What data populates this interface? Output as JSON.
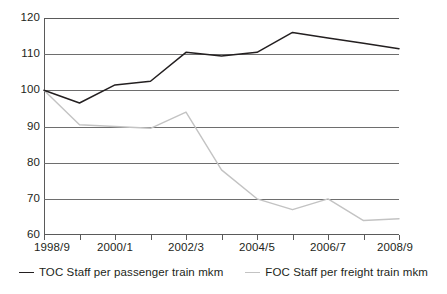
{
  "chart_data": {
    "type": "line",
    "title": "",
    "subtitle": "",
    "xlabel": "",
    "ylabel": "",
    "ylim": [
      60,
      120
    ],
    "yticks": [
      120,
      110,
      100,
      90,
      80,
      70,
      60
    ],
    "grid": true,
    "legend_position": "bottom",
    "x": [
      "1998/9",
      "1999/0",
      "2000/1",
      "2001/2",
      "2002/3",
      "2003/4",
      "2004/5",
      "2005/6",
      "2006/7",
      "2007/8",
      "2008/9"
    ],
    "categories": [
      "1998/9",
      "1999/0",
      "2000/1",
      "2001/2",
      "2002/3",
      "2003/4",
      "2004/5",
      "2005/6",
      "2006/7",
      "2007/8",
      "2008/9"
    ],
    "xtick_labels_shown": [
      "1998/9",
      "",
      "2000/1",
      "",
      "2002/3",
      "",
      "2004/5",
      "",
      "2006/7",
      "",
      "2008/9"
    ],
    "series": [
      {
        "name": "TOC Staff per passenger train mkm",
        "color": "#231f20",
        "values": [
          100,
          96.5,
          101.5,
          102.5,
          110.5,
          109.5,
          110.5,
          116,
          114.5,
          113,
          111.5
        ]
      },
      {
        "name": "FOC Staff per freight train mkm",
        "color": "#c3c3c3",
        "values": [
          100,
          90.5,
          90,
          89.5,
          94,
          78,
          70,
          67,
          70,
          64,
          64.5
        ]
      }
    ]
  },
  "axis": {
    "y_labels": [
      "120",
      "110",
      "100",
      "90",
      "80",
      "70",
      "60"
    ],
    "x_labels": [
      "1998/9",
      "2000/1",
      "2002/3",
      "2004/5",
      "2006/7",
      "2008/9"
    ]
  },
  "legend": {
    "items": [
      {
        "label": "TOC Staff per passenger train mkm",
        "color": "#231f20",
        "key": "toc"
      },
      {
        "label": "FOC Staff per freight train mkm",
        "color": "#c3c3c3",
        "key": "foc"
      }
    ]
  },
  "colors": {
    "toc_line": "#231f20",
    "foc_line": "#c3c3c3",
    "gridline": "#6e6e6e",
    "axis": "#5a5a5a",
    "text": "#231f20",
    "background": "#ffffff"
  }
}
